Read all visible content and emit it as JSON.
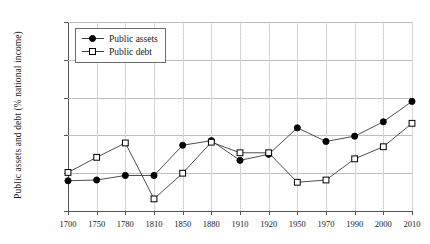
{
  "chart_data": {
    "type": "line",
    "title": "",
    "xlabel": "",
    "ylabel": "Public assets and debt (% national income)",
    "ylim": [
      0,
      250
    ],
    "yticks": [
      "0%",
      "50%",
      "100%",
      "150%",
      "200%",
      "250%"
    ],
    "ytick_values": [
      0,
      50,
      100,
      150,
      200,
      250
    ],
    "grid": true,
    "legend_position": "top-left",
    "categories": [
      "1700",
      "1750",
      "1780",
      "1810",
      "1850",
      "1880",
      "1910",
      "1920",
      "1950",
      "1970",
      "1990",
      "2000",
      "2010"
    ],
    "series": [
      {
        "name": "Public assets",
        "marker": "filled-circle",
        "color": "#000000",
        "values": [
          40,
          41,
          47,
          47,
          87,
          93,
          67,
          75,
          110,
          92,
          99,
          118,
          145
        ]
      },
      {
        "name": "Public debt",
        "marker": "open-square",
        "color": "#000000",
        "values": [
          51,
          71,
          90,
          16,
          50,
          91,
          77,
          77,
          38,
          41,
          69,
          85,
          116
        ]
      }
    ]
  },
  "legend": {
    "items": [
      {
        "label": "Public assets",
        "marker": "filled-circle-icon"
      },
      {
        "label": "Public debt",
        "marker": "open-square-icon"
      }
    ]
  },
  "colors": {
    "line": "#3a3a3a",
    "grid": "#bdbdbd",
    "axis": "#555555",
    "text": "#1a1a1a"
  }
}
